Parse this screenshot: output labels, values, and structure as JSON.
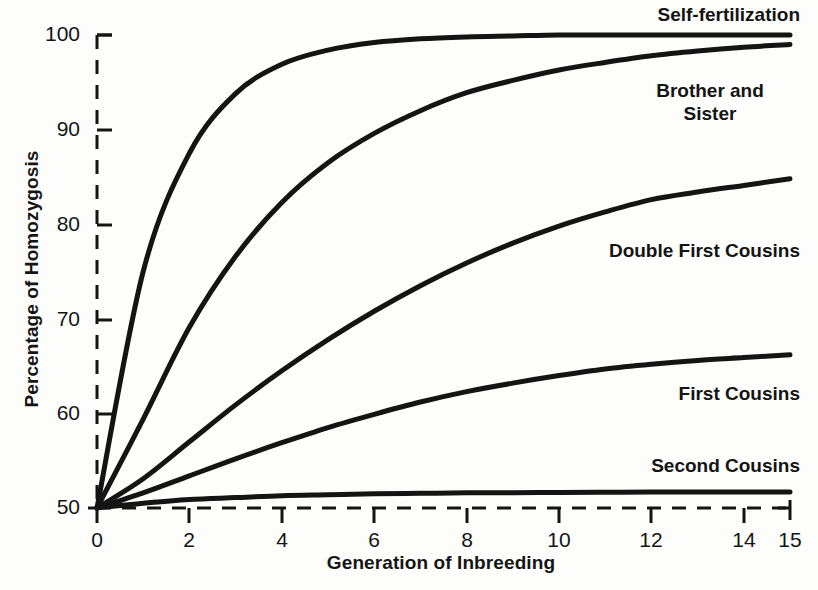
{
  "chart_data": {
    "type": "line",
    "title": "",
    "xlabel": "Generation of Inbreeding",
    "ylabel": "Percentage of Homozygosis",
    "xlim": [
      0,
      15
    ],
    "ylim": [
      50,
      100
    ],
    "xticks": [
      "0",
      "2",
      "4",
      "6",
      "8",
      "10",
      "12",
      "14",
      "15"
    ],
    "xtick_values": [
      0,
      2,
      4,
      6,
      8,
      10,
      12,
      14,
      15
    ],
    "yticks": [
      "50",
      "60",
      "70",
      "80",
      "90",
      "100"
    ],
    "ytick_values": [
      50,
      60,
      70,
      80,
      90,
      100
    ],
    "grid": false,
    "legend_position": "inline-right-of-curves",
    "axis_style": "dashed",
    "line_color": "#141414",
    "background_color": "#fdfdfb",
    "x": [
      0,
      1,
      2,
      3,
      4,
      5,
      6,
      7,
      8,
      9,
      10,
      11,
      12,
      13,
      14,
      15
    ],
    "series": [
      {
        "name": "Self-fertilization",
        "label": "Self-fertilization",
        "values": [
          50,
          75,
          87.5,
          93.8,
          96.9,
          98.4,
          99.2,
          99.6,
          99.8,
          99.9,
          100,
          100,
          100,
          100,
          100,
          100
        ]
      },
      {
        "name": "Brother and Sister",
        "label": "Brother and\nSister",
        "label_line1": "Brother and",
        "label_line2": "Sister",
        "values": [
          50,
          59.4,
          69.1,
          76.6,
          82.3,
          86.5,
          89.6,
          92,
          93.9,
          95.2,
          96.3,
          97.1,
          97.8,
          98.3,
          98.7,
          99
        ]
      },
      {
        "name": "Double First Cousins",
        "label": "Double First Cousins",
        "values": [
          50,
          53.1,
          57,
          60.9,
          64.5,
          67.8,
          70.8,
          73.5,
          75.9,
          78,
          79.8,
          81.3,
          82.6,
          83.4,
          84.1,
          84.8
        ]
      },
      {
        "name": "First Cousins",
        "label": "First Cousins",
        "values": [
          50,
          51.6,
          53.4,
          55.2,
          56.9,
          58.5,
          59.9,
          61.2,
          62.3,
          63.2,
          64,
          64.7,
          65.2,
          65.6,
          65.9,
          66.2
        ]
      },
      {
        "name": "Second Cousins",
        "label": "Second Cousins",
        "values": [
          50,
          50.5,
          50.9,
          51.1,
          51.3,
          51.4,
          51.5,
          51.55,
          51.6,
          51.62,
          51.65,
          51.67,
          51.68,
          51.7,
          51.7,
          51.7
        ]
      }
    ]
  },
  "labels": {
    "self_fertilization": "Self-fertilization",
    "brother_and_sister_line1": "Brother and",
    "brother_and_sister_line2": "Sister",
    "double_first_cousins": "Double First Cousins",
    "first_cousins": "First Cousins",
    "second_cousins": "Second Cousins"
  },
  "axes": {
    "x_title": "Generation of Inbreeding",
    "y_title": "Percentage of Homozygosis",
    "y_tick_100": "100",
    "y_tick_90": "90",
    "y_tick_80": "80",
    "y_tick_70": "70",
    "y_tick_60": "60",
    "y_tick_50": "50",
    "x_tick_0": "0",
    "x_tick_2": "2",
    "x_tick_4": "4",
    "x_tick_6": "6",
    "x_tick_8": "8",
    "x_tick_10": "10",
    "x_tick_12": "12",
    "x_tick_14": "14",
    "x_tick_15": "15"
  }
}
